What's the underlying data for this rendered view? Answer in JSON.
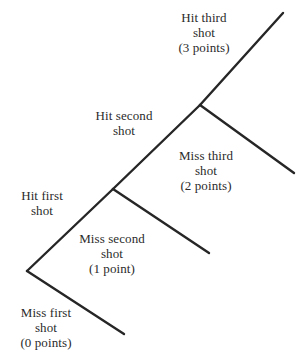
{
  "diagram": {
    "type": "probability-tree",
    "title": "",
    "background_color": "#ffffff",
    "line_color": "#262626",
    "text_color": "#2b2b2b",
    "branches": [
      {
        "id": "hit-first-shot",
        "label_lines": [
          "Hit first",
          "shot"
        ],
        "points": null,
        "from": [
          27,
          271
        ],
        "to": [
          113,
          189
        ]
      },
      {
        "id": "miss-first-shot",
        "label_lines": [
          "Miss first",
          "shot",
          "(0 points)"
        ],
        "points": "0 points",
        "from": [
          27,
          271
        ],
        "to": [
          124,
          334
        ]
      },
      {
        "id": "hit-second-shot",
        "label_lines": [
          "Hit second",
          "shot"
        ],
        "points": null,
        "from": [
          113,
          189
        ],
        "to": [
          200,
          105
        ]
      },
      {
        "id": "miss-second-shot",
        "label_lines": [
          "Miss second",
          "shot",
          "(1 point)"
        ],
        "points": "1 point",
        "from": [
          113,
          189
        ],
        "to": [
          209,
          253
        ]
      },
      {
        "id": "hit-third-shot",
        "label_lines": [
          "Hit third",
          "shot",
          "(3 points)"
        ],
        "points": "3 points",
        "from": [
          200,
          105
        ],
        "to": [
          283,
          13
        ]
      },
      {
        "id": "miss-third-shot",
        "label_lines": [
          "Miss third",
          "shot",
          "(2 points)"
        ],
        "points": "2 points",
        "from": [
          200,
          105
        ],
        "to": [
          294,
          173
        ]
      }
    ],
    "labels": {
      "hit_third": {
        "line1": "Hit third",
        "line2": "shot",
        "line3": "(3 points)"
      },
      "hit_second": {
        "line1": "Hit second",
        "line2": "shot",
        "line3": ""
      },
      "miss_third": {
        "line1": "Miss third",
        "line2": "shot",
        "line3": "(2 points)"
      },
      "hit_first": {
        "line1": "Hit first",
        "line2": "shot",
        "line3": ""
      },
      "miss_second": {
        "line1": "Miss second",
        "line2": "shot",
        "line3": "(1 point)"
      },
      "miss_first": {
        "line1": "Miss first",
        "line2": "shot",
        "line3": "(0 points)"
      }
    }
  }
}
